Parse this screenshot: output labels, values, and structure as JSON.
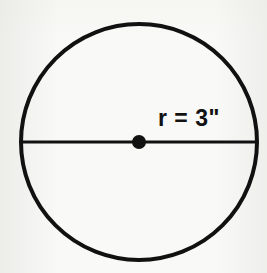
{
  "figure": {
    "name": "circle-with-radius-label",
    "type": "geometry-diagram",
    "background_color": "#f9f9f7",
    "ink_color": "#111111"
  },
  "diagram_data": {
    "type": "diagram",
    "shape": "circle",
    "title": "",
    "circle": {
      "center_x": 139,
      "center_y": 142,
      "radius_px": 118,
      "stroke_width": 4,
      "stroke_color": "#111111",
      "fill": "none"
    },
    "center_point": {
      "label": "",
      "x": 139,
      "y": 142,
      "dot_radius_px": 7,
      "color": "#111111"
    },
    "diameter_line": {
      "x1": 21,
      "y1": 142,
      "x2": 257,
      "y2": 142,
      "stroke_width": 3,
      "stroke_color": "#111111"
    },
    "annotations": [
      {
        "name": "radius-label",
        "text": "r = 3\"",
        "variable": "r",
        "value": 3,
        "unit": "inches",
        "unit_symbol": "\"",
        "x": 158,
        "y": 107
      }
    ]
  },
  "labels": {
    "radius": "r = 3\""
  }
}
